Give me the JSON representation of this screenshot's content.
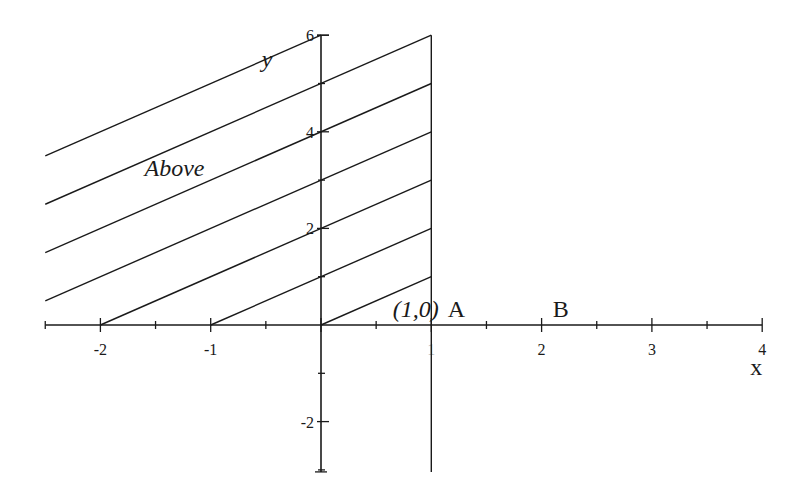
{
  "chart_data": {
    "type": "line",
    "title": "",
    "xlabel": "x",
    "ylabel": "y",
    "xlim": [
      -2.5,
      4
    ],
    "ylim": [
      -3,
      6
    ],
    "x_ticks": [
      -2,
      -1,
      1,
      2,
      3,
      4
    ],
    "x_tick_labels": [
      "-2",
      "-1",
      "1",
      "2",
      "3",
      "4"
    ],
    "x_minor_step": 0.5,
    "y_ticks": [
      -2,
      2,
      4,
      6
    ],
    "y_tick_labels": [
      "-2",
      "2",
      "4",
      "6"
    ],
    "y_minor_step": 1,
    "vertical_line": {
      "x": 1,
      "y_from": -3,
      "y_to": 6
    },
    "series": [
      {
        "name": "y = x + 0",
        "slope": 1,
        "intercept": 0,
        "x_from": 0,
        "x_to": 1
      },
      {
        "name": "y = x + 1",
        "slope": 1,
        "intercept": 1,
        "x_from": -1,
        "x_to": 1
      },
      {
        "name": "y = x + 2",
        "slope": 1,
        "intercept": 2,
        "x_from": -2,
        "x_to": 1
      },
      {
        "name": "y = x + 3",
        "slope": 1,
        "intercept": 3,
        "x_from": -2.5,
        "x_to": 1
      },
      {
        "name": "y = x + 4",
        "slope": 1,
        "intercept": 4,
        "x_from": -2.5,
        "x_to": 1
      },
      {
        "name": "y = x + 5",
        "slope": 1,
        "intercept": 5,
        "x_from": -2.5,
        "x_to": 1
      },
      {
        "name": "y = x + 6",
        "slope": 1,
        "intercept": 6,
        "x_from": -2.5,
        "x_to": 0
      }
    ],
    "annotations": [
      {
        "text": "Above",
        "x": -1.6,
        "y": 3.2,
        "italic": true
      },
      {
        "text": "(1,0)",
        "x": 0.65,
        "y": 0.3,
        "italic": true
      },
      {
        "text": "A",
        "x": 1.15,
        "y": 0.3,
        "italic": false
      },
      {
        "text": "B",
        "x": 2.1,
        "y": 0.3,
        "italic": false
      }
    ]
  }
}
